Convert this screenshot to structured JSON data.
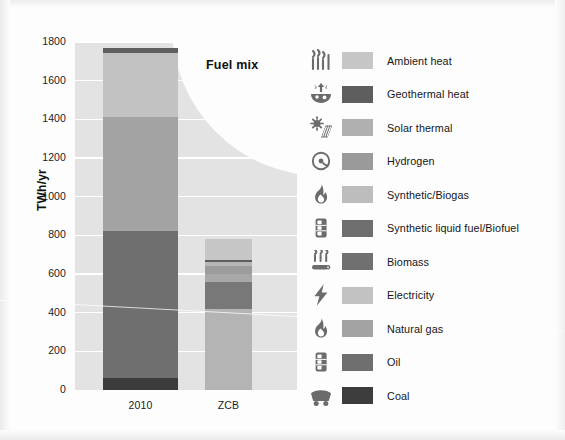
{
  "chart_data": {
    "type": "bar",
    "title": "Fuel mix",
    "xlabel": "",
    "ylabel": "TWh/yr",
    "ylim": [
      0,
      1800
    ],
    "ytick_step": 200,
    "yticks": [
      "1800",
      "1600",
      "1400",
      "1200",
      "1000",
      "800",
      "600",
      "400",
      "200",
      "0"
    ],
    "grid": true,
    "stacked": true,
    "legend_position": "right",
    "categories": [
      "2010",
      "ZCB"
    ],
    "series": [
      {
        "name": "Ambient heat",
        "color": "#c6c6c6",
        "values": [
          0,
          110
        ]
      },
      {
        "name": "Geothermal heat",
        "color": "#5e5e5e",
        "values": [
          0,
          10
        ]
      },
      {
        "name": "Solar thermal",
        "color": "#b0b0b0",
        "values": [
          0,
          20
        ]
      },
      {
        "name": "Hydrogen",
        "color": "#9a9a9a",
        "values": [
          0,
          40
        ]
      },
      {
        "name": "Synthetic/Biogas",
        "color": "#bdbdbd",
        "values": [
          0,
          40
        ]
      },
      {
        "name": "Synthetic liquid fuel/Biofuel",
        "color": "#6e6e6e",
        "values": [
          0,
          0
        ]
      },
      {
        "name": "Biomass",
        "color": "#707070",
        "values": [
          25,
          140
        ]
      },
      {
        "name": "Electricity",
        "color": "#c2c2c2",
        "values": [
          335,
          420
        ]
      },
      {
        "name": "Natural gas",
        "color": "#a3a3a3",
        "values": [
          590,
          0
        ]
      },
      {
        "name": "Oil",
        "color": "#6f6f6f",
        "values": [
          760,
          0
        ]
      },
      {
        "name": "Coal",
        "color": "#3c3c3c",
        "values": [
          60,
          0
        ]
      }
    ],
    "totals": {
      "2010": 1770,
      "ZCB": 780
    }
  },
  "plot": {
    "y_axis_title": "TWh/yr",
    "annotation": "Fuel mix",
    "bars": [
      {
        "category": "2010",
        "total": 1770,
        "segments": [
          {
            "name": "Coal",
            "from": 0,
            "to": 60,
            "color": "#3c3c3c"
          },
          {
            "name": "Oil",
            "from": 60,
            "to": 820,
            "color": "#6f6f6f"
          },
          {
            "name": "Natural gas",
            "from": 820,
            "to": 1410,
            "color": "#a3a3a3"
          },
          {
            "name": "Electricity",
            "from": 1410,
            "to": 1745,
            "color": "#c2c2c2"
          },
          {
            "name": "Biomass",
            "from": 1745,
            "to": 1770,
            "color": "#5f5f5f"
          }
        ]
      },
      {
        "category": "ZCB",
        "total": 780,
        "segments": [
          {
            "name": "Electricity",
            "from": 0,
            "to": 420,
            "color": "#b4b4b4"
          },
          {
            "name": "Biomass",
            "from": 420,
            "to": 560,
            "color": "#787878"
          },
          {
            "name": "Synthetic/Biogas",
            "from": 560,
            "to": 600,
            "color": "#a8a8a8"
          },
          {
            "name": "Hydrogen",
            "from": 600,
            "to": 640,
            "color": "#9c9c9c"
          },
          {
            "name": "Solar thermal",
            "from": 640,
            "to": 660,
            "color": "#b6b6b6"
          },
          {
            "name": "Geothermal heat",
            "from": 660,
            "to": 672,
            "color": "#5e5e5e"
          },
          {
            "name": "Ambient heat",
            "from": 672,
            "to": 780,
            "color": "#c6c6c6"
          }
        ]
      }
    ]
  },
  "legend": {
    "items": [
      {
        "label": "Ambient heat",
        "color": "#c6c6c6",
        "icon": "heat-waves-icon"
      },
      {
        "label": "Geothermal heat",
        "color": "#5e5e5e",
        "icon": "geothermal-icon"
      },
      {
        "label": "Solar thermal",
        "color": "#b0b0b0",
        "icon": "solar-panel-icon"
      },
      {
        "label": "Hydrogen",
        "color": "#9a9a9a",
        "icon": "atom-icon"
      },
      {
        "label": "Synthetic/Biogas",
        "color": "#bdbdbd",
        "icon": "flame-icon"
      },
      {
        "label": "Synthetic liquid fuel/Biofuel",
        "color": "#6e6e6e",
        "icon": "barrel-icon"
      },
      {
        "label": "Biomass",
        "color": "#707070",
        "icon": "biomass-log-icon"
      },
      {
        "label": "Electricity",
        "color": "#c2c2c2",
        "icon": "lightning-bolt-icon"
      },
      {
        "label": "Natural gas",
        "color": "#a3a3a3",
        "icon": "flame-icon"
      },
      {
        "label": "Oil",
        "color": "#6f6f6f",
        "icon": "barrel-icon"
      },
      {
        "label": "Coal",
        "color": "#3c3c3c",
        "icon": "coal-cart-icon"
      }
    ]
  },
  "theme": {
    "plot_background": "#e3e3e3",
    "gridline_color": "#ffffff",
    "page_background": "#fdfdfd",
    "text_color": "#1b1b1b"
  }
}
